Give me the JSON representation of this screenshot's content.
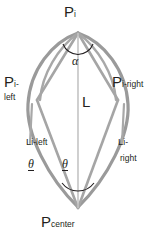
{
  "figure": {
    "type": "geometry-diagram",
    "colors": {
      "curve": "#9d9d9d",
      "line": "#b0b0b0",
      "center_line": "#c9c9c9",
      "text": "#231f20",
      "arc": "#231f20",
      "background": "#ffffff"
    },
    "points": {
      "apex": {
        "label_main": "P",
        "label_sub": "i",
        "x": 78,
        "y": 32
      },
      "left": {
        "label_main": "P",
        "label_sub": "i-",
        "label_sub2": "left",
        "x": 37,
        "y": 100
      },
      "right": {
        "label_main": "P",
        "label_sub": "i-right",
        "x": 118,
        "y": 100
      },
      "center": {
        "label_main": "P",
        "label_sub": "center",
        "x": 78,
        "y": 208
      }
    },
    "segments": {
      "center_length": {
        "label": "L"
      },
      "left_length": {
        "label_main": "L",
        "label_sub": "i-left"
      },
      "right_length": {
        "label_main": "L",
        "label_sub": "i-",
        "label_sub2": "right"
      }
    },
    "angles": {
      "apex_angle": {
        "symbol": "α"
      },
      "theta_left": {
        "symbol": "θ"
      },
      "theta_right": {
        "symbol": "θ"
      }
    }
  }
}
